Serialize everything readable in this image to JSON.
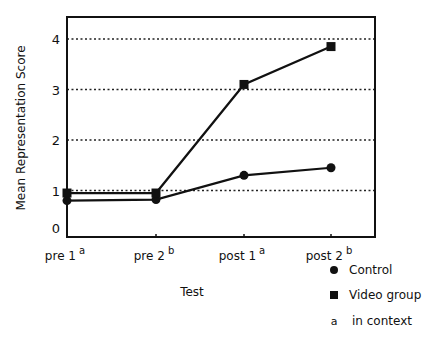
{
  "chart_data": {
    "type": "line",
    "title": "",
    "xlabel": "Test",
    "ylabel": "Mean Representation Score",
    "categories": [
      {
        "label": "pre 1",
        "sup": "a"
      },
      {
        "label": "pre 2",
        "sup": "b"
      },
      {
        "label": "post 1",
        "sup": "a"
      },
      {
        "label": "post 2",
        "sup": "b"
      }
    ],
    "yticks": [
      0,
      1,
      2,
      3,
      4
    ],
    "ylim": [
      0,
      4.4
    ],
    "grid": "horizontal dotted at 1,2,3,4",
    "series": [
      {
        "name": "Control",
        "marker": "circle",
        "values": [
          0.8,
          0.82,
          1.3,
          1.45
        ]
      },
      {
        "name": "Video group",
        "marker": "square",
        "values": [
          0.95,
          0.95,
          3.1,
          3.85
        ]
      }
    ],
    "legend": {
      "position": "bottom-right, below plot",
      "entries": [
        {
          "symbol": "circle",
          "text": "Control"
        },
        {
          "symbol": "square",
          "text": "Video group"
        },
        {
          "symbol": "a",
          "text": "in context"
        }
      ]
    }
  }
}
